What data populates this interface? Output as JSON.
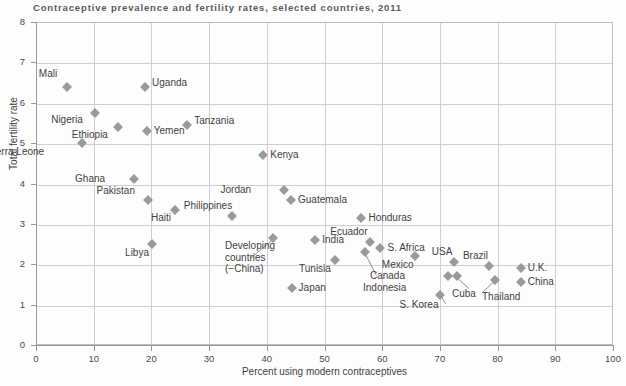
{
  "chart_data": {
    "type": "scatter",
    "title": "Contraceptive prevalence and fertility rates, selected countries, 2011",
    "xlabel": "Percent using modern contraceptives",
    "ylabel": "Total fertility rate",
    "xlim": [
      0,
      100
    ],
    "ylim": [
      0,
      8
    ],
    "xticks": [
      0,
      10,
      20,
      30,
      40,
      50,
      60,
      70,
      80,
      90,
      100
    ],
    "yticks": [
      0,
      1,
      2,
      3,
      4,
      5,
      6,
      7,
      8
    ],
    "grid": true,
    "legend": "none",
    "marker_shape": "diamond",
    "marker_color": "#9a9a9a",
    "points": [
      {
        "label": "Mali",
        "x": 5.4,
        "y": 6.4,
        "label_dx": -14,
        "label_dy": -14
      },
      {
        "label": "Uganda",
        "x": 18.9,
        "y": 6.4,
        "label_dx": 7,
        "label_dy": -5
      },
      {
        "label": "Nigeria",
        "x": 10.2,
        "y": 5.75,
        "label_dx": -16,
        "label_dy": 6
      },
      {
        "label": "Ethiopia",
        "x": 14.2,
        "y": 5.4,
        "label_dx": -14,
        "label_dy": 7
      },
      {
        "label": "Yemen",
        "x": 19.2,
        "y": 5.3,
        "label_dx": 7,
        "label_dy": -1
      },
      {
        "label": "Tanzania",
        "x": 26.2,
        "y": 5.45,
        "label_dx": 7,
        "label_dy": -5
      },
      {
        "label": "Sierra Leone",
        "x": 8.0,
        "y": 5.0,
        "label_dx": -42,
        "label_dy": 8
      },
      {
        "label": "Kenya",
        "x": 39.4,
        "y": 4.7,
        "label_dx": 7,
        "label_dy": -1
      },
      {
        "label": "Ghana",
        "x": 17.0,
        "y": 4.1,
        "label_dx": -33,
        "label_dy": -1
      },
      {
        "label": "Pakistan",
        "x": 19.4,
        "y": 3.6,
        "label_dx": -17,
        "label_dy": -10
      },
      {
        "label": "Haiti",
        "x": 24.1,
        "y": 3.35,
        "label_dx": -8,
        "label_dy": 7
      },
      {
        "label": "Jordan",
        "x": 43.0,
        "y": 3.85,
        "label_dx": -37,
        "label_dy": -1
      },
      {
        "label": "Guatemala",
        "x": 44.2,
        "y": 3.6,
        "label_dx": 7,
        "label_dy": -1
      },
      {
        "label": "Philippines",
        "x": 34.0,
        "y": 3.2,
        "label_dx": -4,
        "label_dy": -11
      },
      {
        "label": "Honduras",
        "x": 56.4,
        "y": 3.15,
        "label_dx": 7,
        "label_dy": -1
      },
      {
        "label": "Libya",
        "x": 20.1,
        "y": 2.5,
        "label_dx": -7,
        "label_dy": 8
      },
      {
        "label": "Developing countries (−China)",
        "x": 41.0,
        "y": 2.65,
        "label_dx": 0,
        "label_dy": 0
      },
      {
        "label": "India",
        "x": 48.4,
        "y": 2.6,
        "label_dx": 7,
        "label_dy": -1
      },
      {
        "label": "Ecuador",
        "x": 57.8,
        "y": 2.55,
        "label_dx": -6,
        "label_dy": -11
      },
      {
        "label": "S. Africa",
        "x": 59.7,
        "y": 2.4,
        "label_dx": 7,
        "label_dy": -1
      },
      {
        "label": "Mexico",
        "x": 65.6,
        "y": 2.2,
        "label_dx": -5,
        "label_dy": 8
      },
      {
        "label": "USA",
        "x": 72.5,
        "y": 2.05,
        "label_dx": -6,
        "label_dy": -11
      },
      {
        "label": "Brazil",
        "x": 78.5,
        "y": 1.95,
        "label_dx": -5,
        "label_dy": -11
      },
      {
        "label": "U.K.",
        "x": 84.0,
        "y": 1.9,
        "label_dx": 7,
        "label_dy": -1
      },
      {
        "label": "Tunisia",
        "x": 51.8,
        "y": 2.1,
        "label_dx": -8,
        "label_dy": 8
      },
      {
        "label": "Indonesia",
        "x": 57.1,
        "y": 2.3,
        "label_dx": 0,
        "label_dy": 0
      },
      {
        "label": "Canada",
        "x": 71.4,
        "y": 1.7,
        "label_dx": -47,
        "label_dy": -1
      },
      {
        "label": "Cuba",
        "x": 73.0,
        "y": 1.7,
        "label_dx": 0,
        "label_dy": 0
      },
      {
        "label": "Thailand",
        "x": 79.5,
        "y": 1.6,
        "label_dx": 0,
        "label_dy": 0
      },
      {
        "label": "China",
        "x": 84.0,
        "y": 1.55,
        "label_dx": 7,
        "label_dy": -1
      },
      {
        "label": "Japan",
        "x": 44.3,
        "y": 1.4,
        "label_dx": 7,
        "label_dy": -1
      },
      {
        "label": "S. Korea",
        "x": 70.1,
        "y": 1.25,
        "label_dx": -6,
        "label_dy": 9
      }
    ],
    "leader_lines": [
      {
        "name": "developing-countries-leader",
        "x1": 41.0,
        "y1": 2.6,
        "x2": 37.2,
        "y2": 2.15
      },
      {
        "name": "indonesia-leader",
        "x1": 57.1,
        "y1": 2.25,
        "x2": 59.0,
        "y2": 1.72
      },
      {
        "name": "cuba-leader",
        "x1": 73.0,
        "y1": 1.66,
        "x2": 75.0,
        "y2": 1.4
      },
      {
        "name": "thailand-leader",
        "x1": 79.3,
        "y1": 1.56,
        "x2": 77.4,
        "y2": 1.3
      },
      {
        "name": "s-korea-leader",
        "x1": 70.1,
        "y1": 1.22,
        "x2": 71.0,
        "y2": 1.02
      }
    ]
  }
}
